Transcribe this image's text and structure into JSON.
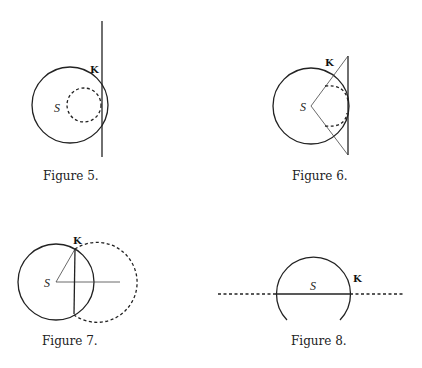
{
  "figures": [
    {
      "caption": "Figure 5.",
      "labels": {
        "center": "S",
        "point": "K"
      }
    },
    {
      "caption": "Figure 6.",
      "labels": {
        "center": "S",
        "point": "K"
      }
    },
    {
      "caption": "Figure 7.",
      "labels": {
        "center": "S",
        "point": "K"
      }
    },
    {
      "caption": "Figure 8.",
      "labels": {
        "center": "S",
        "point": "K"
      }
    }
  ]
}
